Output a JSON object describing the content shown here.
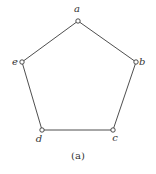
{
  "diagram": {
    "type": "graph",
    "shape": "pentagon",
    "caption": "(a)",
    "vertices": [
      {
        "id": "a",
        "label": "a",
        "x": 78,
        "y": 21,
        "lx": 77,
        "ly": 12,
        "anchor": "middle"
      },
      {
        "id": "b",
        "label": "b",
        "x": 136,
        "y": 62,
        "lx": 139,
        "ly": 65,
        "anchor": "start"
      },
      {
        "id": "c",
        "label": "c",
        "x": 113,
        "y": 130,
        "lx": 115,
        "ly": 141,
        "anchor": "middle"
      },
      {
        "id": "d",
        "label": "d",
        "x": 42,
        "y": 130,
        "lx": 39,
        "ly": 142,
        "anchor": "middle"
      },
      {
        "id": "e",
        "label": "e",
        "x": 22,
        "y": 62,
        "lx": 18,
        "ly": 65,
        "anchor": "end"
      }
    ],
    "edges": [
      [
        "a",
        "b"
      ],
      [
        "b",
        "c"
      ],
      [
        "c",
        "d"
      ],
      [
        "d",
        "e"
      ],
      [
        "e",
        "a"
      ]
    ]
  }
}
